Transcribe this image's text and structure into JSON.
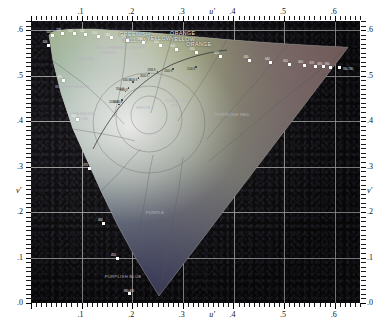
{
  "figure": {
    "kind": "cie-1976-ucs-chromaticity-diagram",
    "axis": {
      "x_symbol": "u'",
      "y_symbol": "v'",
      "x_ticks": [
        ".0",
        ".1",
        ".2",
        ".3",
        ".4",
        ".5",
        ".6"
      ],
      "y_ticks": [
        ".0",
        ".1",
        ".2",
        ".3",
        ".4",
        ".5",
        ".6"
      ],
      "x_range": [
        0.0,
        0.65
      ],
      "y_range": [
        0.0,
        0.62
      ],
      "x_major_step": 0.1,
      "y_major_step": 0.1,
      "grid": true,
      "mirrored_labels": true
    },
    "colors": {
      "background": "#0a0a0c",
      "grid": "#cfcfcf",
      "marker": "#ffffff",
      "label_light": "#f2f2f2",
      "label_dark": "#2b2b2b"
    },
    "color_regions": [
      {
        "label": "GREENISH\nYELLOW",
        "u": 0.205,
        "v": 0.588,
        "tone": "hi"
      },
      {
        "label": "YELLOW",
        "u": 0.253,
        "v": 0.578,
        "tone": "hi"
      },
      {
        "label": "ORANGE\nYELLOW",
        "u": 0.3,
        "v": 0.59,
        "tone": "hi"
      },
      {
        "label": "ORANGE",
        "u": 0.332,
        "v": 0.566,
        "tone": "hi"
      },
      {
        "label": "GREEN",
        "u": 0.107,
        "v": 0.533,
        "tone": "dk"
      },
      {
        "label": "BLUISH GREEN",
        "u": 0.082,
        "v": 0.47,
        "tone": "dk"
      },
      {
        "label": "GREENISH\nBLUE",
        "u": 0.101,
        "v": 0.412,
        "tone": "dk"
      },
      {
        "label": "BLUE",
        "u": 0.14,
        "v": 0.272,
        "tone": "dk"
      },
      {
        "label": "PURPLISH BLUE",
        "u": 0.182,
        "v": 0.053,
        "tone": "dk"
      },
      {
        "label": "PURPLE",
        "u": 0.245,
        "v": 0.193,
        "tone": "dk"
      },
      {
        "label": "PURPLISH RED",
        "u": 0.398,
        "v": 0.41,
        "tone": "dk"
      },
      {
        "label": "PURPLISH\nPINK",
        "u": 0.288,
        "v": 0.44,
        "tone": "dk"
      },
      {
        "label": "PINK",
        "u": 0.31,
        "v": 0.487,
        "tone": "dk"
      },
      {
        "label": "WHITE",
        "u": 0.222,
        "v": 0.425,
        "tone": "dk"
      },
      {
        "label": "YELLOW GREEN",
        "u": 0.19,
        "v": 0.556,
        "tone": "dk"
      },
      {
        "label": "YELLOWISH\nGREEN",
        "u": 0.152,
        "v": 0.556,
        "tone": "dk"
      }
    ],
    "spectral_markers": [
      {
        "nm": "480",
        "u": 0.091,
        "v": 0.404
      },
      {
        "nm": "470",
        "u": 0.115,
        "v": 0.296
      },
      {
        "nm": "460",
        "u": 0.144,
        "v": 0.175
      },
      {
        "nm": "450",
        "u": 0.17,
        "v": 0.098
      },
      {
        "nm": "380-400",
        "u": 0.195,
        "v": 0.02
      },
      {
        "nm": "490",
        "u": 0.064,
        "v": 0.49
      },
      {
        "nm": "500",
        "u": 0.035,
        "v": 0.567
      },
      {
        "nm": "510",
        "u": 0.042,
        "v": 0.588
      },
      {
        "nm": "520",
        "u": 0.062,
        "v": 0.593
      },
      {
        "nm": "530",
        "u": 0.085,
        "v": 0.592
      },
      {
        "nm": "540",
        "u": 0.108,
        "v": 0.59
      },
      {
        "nm": "550",
        "u": 0.133,
        "v": 0.587
      },
      {
        "nm": "560",
        "u": 0.159,
        "v": 0.583
      },
      {
        "nm": "570",
        "u": 0.19,
        "v": 0.578
      },
      {
        "nm": "580",
        "u": 0.223,
        "v": 0.573
      },
      {
        "nm": "590",
        "u": 0.255,
        "v": 0.566
      },
      {
        "nm": "600",
        "u": 0.287,
        "v": 0.558
      },
      {
        "nm": "610",
        "u": 0.326,
        "v": 0.551
      },
      {
        "nm": "620",
        "u": 0.374,
        "v": 0.542
      },
      {
        "nm": "630",
        "u": 0.432,
        "v": 0.534
      },
      {
        "nm": "640",
        "u": 0.474,
        "v": 0.529
      },
      {
        "nm": "650",
        "u": 0.51,
        "v": 0.525
      },
      {
        "nm": "660",
        "u": 0.54,
        "v": 0.522
      },
      {
        "nm": "670",
        "u": 0.562,
        "v": 0.52
      },
      {
        "nm": "680",
        "u": 0.578,
        "v": 0.519
      },
      {
        "nm": "690",
        "u": 0.592,
        "v": 0.518
      },
      {
        "nm": "700-780",
        "u": 0.61,
        "v": 0.517
      }
    ],
    "planckian_locus": {
      "caption": "blackbody / correlated colour temperature locus",
      "points": [
        {
          "label": "10000 K",
          "u": 0.18,
          "v": 0.446
        },
        {
          "label": "6000 K",
          "u": 0.193,
          "v": 0.473
        },
        {
          "label": "4000 K",
          "u": 0.212,
          "v": 0.495
        },
        {
          "label": "3000 K",
          "u": 0.2335,
          "v": 0.5045
        },
        {
          "label": "2000 K",
          "u": 0.281,
          "v": 0.515
        },
        {
          "label": "1500 K",
          "u": 0.326,
          "v": 0.519
        }
      ]
    },
    "illuminant_ticks": [
      {
        "label": "2856 K",
        "u": 0.25,
        "v": 0.508
      },
      {
        "label": "5000 K",
        "u": 0.201,
        "v": 0.486
      },
      {
        "label": "7000 K",
        "u": 0.187,
        "v": 0.465
      },
      {
        "label": "20000 K",
        "u": 0.174,
        "v": 0.436
      }
    ]
  }
}
